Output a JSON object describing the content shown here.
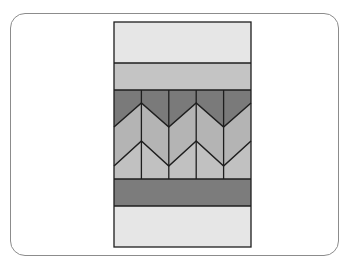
{
  "diagram": {
    "type": "quilt-block-chevron-pattern",
    "colors": {
      "frame_border": "#8c8c8c",
      "outline": "#1e1e1e",
      "light_band": "#e6e6e6",
      "medium_band": "#c4c4c4",
      "dark_chevron": "#7a7a7a",
      "mid_chevron": "#b4b4b4",
      "light_chevron": "#c1c1c1",
      "dark_band": "#7c7c7c"
    },
    "bands": [
      {
        "name": "top-light-band",
        "color": "#e6e6e6"
      },
      {
        "name": "medium-band",
        "color": "#c4c4c4"
      },
      {
        "name": "chevron-section",
        "columns": 5,
        "chevron_rows": 2
      },
      {
        "name": "dark-band",
        "color": "#7c7c7c"
      },
      {
        "name": "bottom-light-band",
        "color": "#e6e6e6"
      }
    ]
  }
}
